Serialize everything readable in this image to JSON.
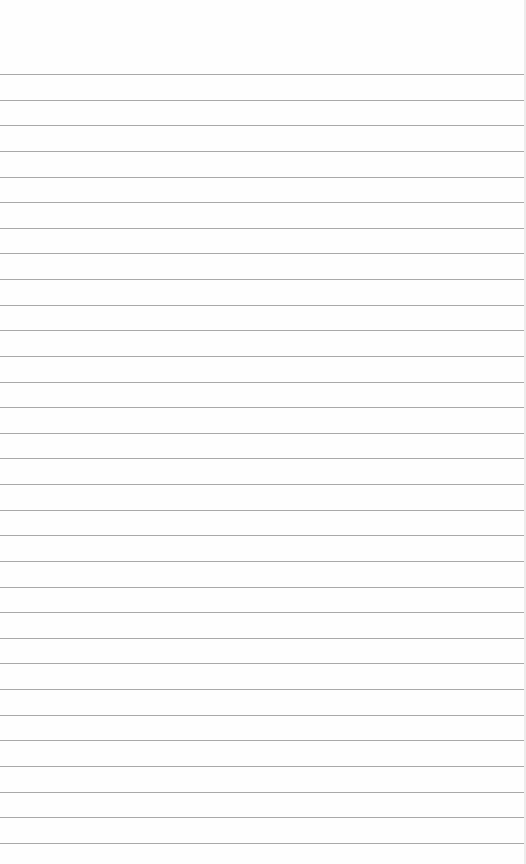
{
  "paper": {
    "type": "lined-paper",
    "line_count": 31,
    "first_line_y": 74,
    "line_spacing": 25.63,
    "line_color": "#9a9a9a",
    "background_color": "#fefefe"
  }
}
